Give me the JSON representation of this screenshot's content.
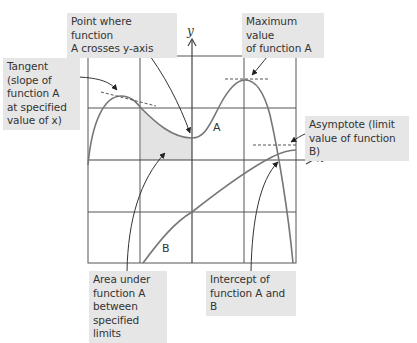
{
  "diagram": {
    "axes": {
      "x_label": "x",
      "y_label": "y"
    },
    "curves": {
      "a_label": "A",
      "b_label": "B"
    },
    "annotations": {
      "tangent": [
        "Tangent",
        "(slope of",
        "function A",
        "at specified",
        "value of x)"
      ],
      "y_crossing": [
        "Point where function",
        "A crosses y-axis"
      ],
      "maximum": [
        "Maximum value",
        "of function A"
      ],
      "asymptote": [
        "Asymptote (limit",
        "value of function B)"
      ],
      "area": [
        "Area under",
        "function A",
        "between",
        "specified limits"
      ],
      "intercept": [
        "Intercept of",
        "function A and B"
      ]
    },
    "colors": {
      "grid": "#555555",
      "curve": "#777777",
      "shade": "#e3e3e3",
      "label_bg": "#e6e6e6",
      "text": "#333333"
    }
  }
}
